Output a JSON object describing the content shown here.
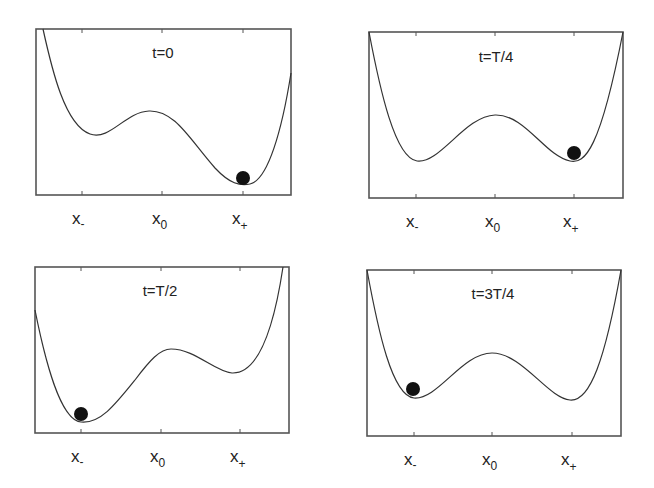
{
  "figure": {
    "panels": [
      {
        "title": "t=0",
        "ball_well": "x+",
        "ticks": {
          "left": "x",
          "left_sub": "-",
          "mid": "x",
          "mid_sub": "0",
          "right": "x",
          "right_sub": "+"
        }
      },
      {
        "title": "t=T/4",
        "ball_well": "x+",
        "ticks": {
          "left": "x",
          "left_sub": "-",
          "mid": "x",
          "mid_sub": "0",
          "right": "x",
          "right_sub": "+"
        }
      },
      {
        "title": "t=T/2",
        "ball_well": "x-",
        "ticks": {
          "left": "x",
          "left_sub": "-",
          "mid": "x",
          "mid_sub": "0",
          "right": "x",
          "right_sub": "+"
        }
      },
      {
        "title": "t=3T/4",
        "ball_well": "x-",
        "ticks": {
          "left": "x",
          "left_sub": "-",
          "mid": "x",
          "mid_sub": "0",
          "right": "x",
          "right_sub": "+"
        }
      }
    ],
    "colors": {
      "frame": "#555555",
      "curve": "#333333",
      "ball": "#111111",
      "background": "#ffffff"
    }
  }
}
